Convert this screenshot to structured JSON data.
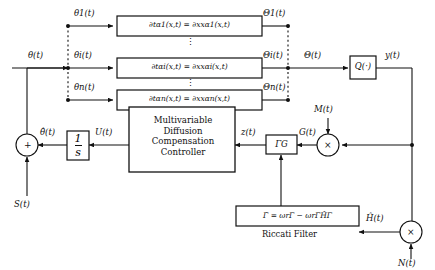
{
  "diagram": {
    "background": "#ffffff",
    "line_color": "#111111"
  },
  "plant_rows": [
    {
      "id": "row-1",
      "input_label": "θ1(t)",
      "equation": "∂tα1(x,t) = ∂xxα1(x,t)",
      "output_label": "Θ1(t)"
    },
    {
      "id": "row-i",
      "input_label": "θi(t)",
      "equation": "∂tαi(x,t) = ∂xxαi(x,t)",
      "output_label": "Θi(t)"
    },
    {
      "id": "row-n",
      "input_label": "θn(t)",
      "equation": "∂tαn(x,t) = ∂xxαn(x,t)",
      "output_label": "Θn(t)"
    }
  ],
  "signals": {
    "theta_input": "θ(t)",
    "theta_bus_output": "Θ(t)",
    "plant_output": "y(t)",
    "modulation_M": "M(t)",
    "demodulated_G": "G(t)",
    "riccati_gain_output": "z(t)",
    "controller_output": "U(t)",
    "integrator_output": "θ̂(t)",
    "dither_S": "S(t)",
    "hessian_estimate": "Ĥ(t)",
    "modulation_N": "N(t)"
  },
  "blocks": {
    "nonlinear_map": "Q(·)",
    "gain_gamma_g": "ΓG",
    "integrator_num": "1",
    "integrator_den": "s",
    "controller_lines": [
      "Multivariable",
      "Diffusion",
      "Compensation",
      "Controller"
    ],
    "riccati_equation": "Γ̇ = ωrΓ − ωrΓĤΓ",
    "riccati_caption": "Riccati Filter"
  },
  "operators": {
    "sum_junction_sign": "+",
    "multiplier_glyph": "×"
  },
  "vertical_dots": "⋮"
}
